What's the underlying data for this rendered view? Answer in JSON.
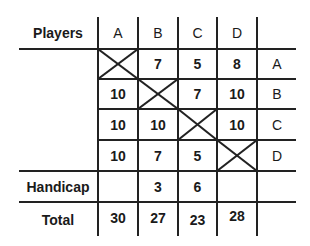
{
  "table": {
    "corner_label": "Players",
    "columns": [
      "A",
      "B",
      "C",
      "D"
    ],
    "row_labels": [
      "A",
      "B",
      "C",
      "D"
    ],
    "rows": [
      [
        "X",
        "7",
        "5",
        "8"
      ],
      [
        "10",
        "X",
        "7",
        "10"
      ],
      [
        "10",
        "10",
        "X",
        "10"
      ],
      [
        "10",
        "7",
        "5",
        "X"
      ]
    ],
    "handicap": {
      "label": "Handicap",
      "values": [
        "",
        "3",
        "6",
        ""
      ]
    },
    "total": {
      "label": "Total",
      "values": [
        "30",
        "27",
        "23",
        "28"
      ]
    }
  }
}
